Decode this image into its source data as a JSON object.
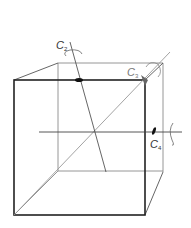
{
  "diagram": {
    "axes": [
      {
        "id": "C2",
        "label": "C",
        "subscript": "2",
        "description": "two-fold axis through edge midpoints"
      },
      {
        "id": "C3",
        "label": "C",
        "subscript": "3",
        "description": "three-fold axis through body diagonal"
      },
      {
        "id": "C4",
        "label": "C",
        "subscript": "4",
        "description": "four-fold axis through face centers"
      }
    ],
    "colors": {
      "front_edges": "#222222",
      "back_edges": "#888888",
      "axis_lines": "#444444",
      "rotation_arrows": "#777777"
    }
  }
}
